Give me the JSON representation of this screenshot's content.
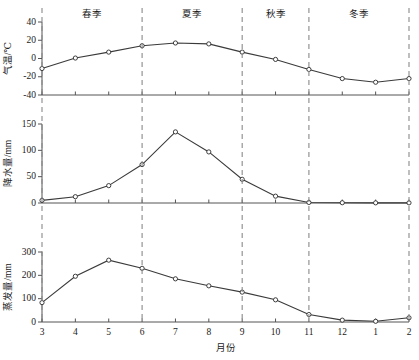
{
  "chart_data": {
    "type": "line",
    "title": "",
    "xlabel": "月份",
    "x": [
      3,
      4,
      5,
      6,
      7,
      8,
      9,
      10,
      11,
      12,
      1,
      2
    ],
    "xticklabels": [
      "3",
      "4",
      "5",
      "6",
      "7",
      "8",
      "9",
      "10",
      "11",
      "12",
      "1",
      "2"
    ],
    "grid": false,
    "legend": "none",
    "annotations": [
      {
        "label": "春季",
        "span": [
          3,
          5
        ]
      },
      {
        "label": "夏季",
        "span": [
          6,
          8
        ]
      },
      {
        "label": "秋季",
        "span": [
          9,
          10
        ]
      },
      {
        "label": "冬季",
        "span": [
          11,
          2
        ]
      }
    ],
    "panels": [
      {
        "name": "temperature",
        "ylabel": "气温/℃",
        "ylim": [
          -40,
          40
        ],
        "yticks": [
          -40,
          -20,
          0,
          20,
          40
        ],
        "yticklabels": [
          "-40",
          "-20",
          "0",
          "20",
          "40"
        ],
        "values": [
          -11,
          0.5,
          7,
          14,
          17,
          16,
          7,
          -1,
          -12,
          -22,
          -26,
          -22
        ]
      },
      {
        "name": "precipitation",
        "ylabel": "降水量/mm",
        "ylim": [
          0,
          150
        ],
        "yticks": [
          0,
          50,
          100,
          150
        ],
        "yticklabels": [
          "0",
          "50",
          "100",
          "150"
        ],
        "values": [
          5,
          12,
          33,
          73,
          135,
          97,
          45,
          13,
          1,
          0.5,
          0.3,
          0.3
        ]
      },
      {
        "name": "evaporation",
        "ylabel": "蒸发量/mm",
        "ylim": [
          0,
          300
        ],
        "yticks": [
          0,
          100,
          200,
          300
        ],
        "yticklabels": [
          "0",
          "100",
          "200",
          "300"
        ],
        "values": [
          83,
          196,
          265,
          230,
          185,
          155,
          128,
          95,
          32,
          8,
          3,
          18
        ]
      }
    ],
    "colors": {
      "line": "#3a3a3a",
      "marker_face": "#ffffff",
      "marker_edge": "#2b2b2b",
      "axis": "#555555",
      "divider": "#8a8a8a",
      "text": "#1a1a1a"
    }
  }
}
